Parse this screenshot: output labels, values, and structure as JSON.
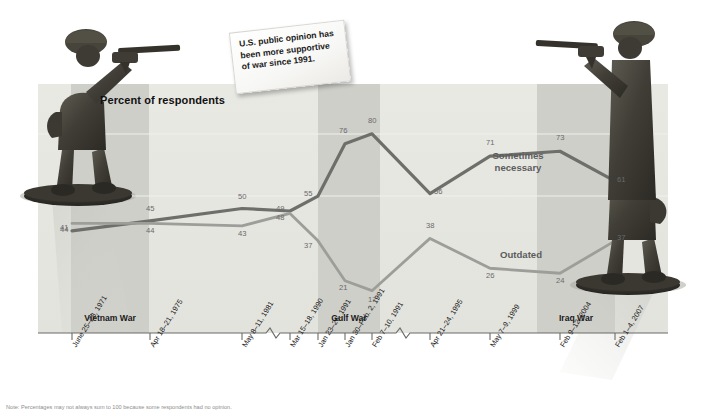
{
  "title": "Percent of respondents",
  "callout": "U.S. public opinion has been more supportive of war since 1991.",
  "note": "Note: Percentages may not always sum to 100 because some respondents had no opinion.",
  "series_labels": {
    "sometimes": "Sometimes necessary",
    "outdated": "Outdated"
  },
  "bands": [
    {
      "name": "Vietnam War",
      "label": "Vietnam War"
    },
    {
      "name": "Gulf War",
      "label": "Gulf War"
    },
    {
      "name": "Iraq War",
      "label": "Iraq War"
    }
  ],
  "colors": {
    "sometimes_line": "#6e6e6b",
    "outdated_line": "#9d9d99",
    "band_fill": "#cfcfca",
    "plot_fill": "#e6e6e1",
    "axis": "#6b6b66",
    "data_label": "#6a6a6a"
  },
  "chart_data": {
    "type": "line",
    "title": "Percent of respondents",
    "xlabel": "",
    "ylabel": "Percent of respondents",
    "ylim": [
      0,
      100
    ],
    "grid": false,
    "legend_position": "inline-labels",
    "axis_breaks": [
      "after May 8-11, 1981",
      "after Feb 7-10, 1991"
    ],
    "categories": [
      "June 25–28, 1971",
      "Apr 18–21, 1975",
      "May 8–11, 1981",
      "Mar 15–18, 1990",
      "Jan 23–26, 1991",
      "Jan 30–Feb. 2, 1991",
      "Feb 7–10, 1991",
      "Apr 21–24, 1995",
      "May 7–9, 1999",
      "Feb 9–12, 2004",
      "Feb 1–4, 2007"
    ],
    "series": [
      {
        "name": "Sometimes necessary",
        "color": "#6e6e6b",
        "values": [
          41,
          45,
          50,
          49,
          55,
          76,
          80,
          56,
          71,
          73,
          61
        ]
      },
      {
        "name": "Outdated",
        "color": "#9d9d99",
        "values": [
          44,
          44,
          43,
          48,
          37,
          21,
          17,
          38,
          26,
          24,
          37
        ]
      }
    ],
    "war_bands": [
      {
        "label": "Vietnam War",
        "start_category": "June 25–28, 1971",
        "end_category": "Apr 18–21, 1975"
      },
      {
        "label": "Gulf War",
        "start_category": "Jan 23–26, 1991",
        "end_category": "Feb 7–10, 1991"
      },
      {
        "label": "Iraq War",
        "start_category": "Feb 9–12, 2004",
        "end_category": "Feb 1–4, 2007"
      }
    ]
  }
}
